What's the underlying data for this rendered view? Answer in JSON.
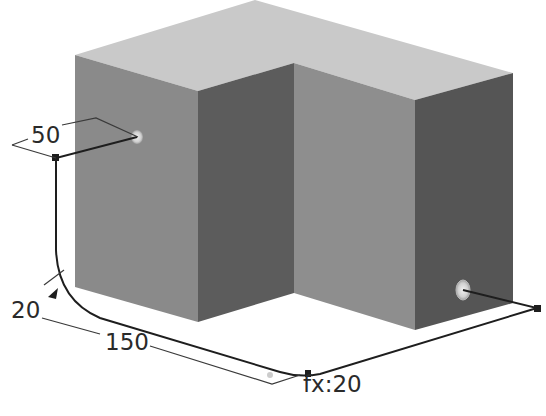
{
  "diagram": {
    "colors": {
      "background": "#ffffff",
      "top_face": "#c9c9c9",
      "left_face": "#8a8a8a",
      "front_inner_face": "#5c5c5c",
      "inner_right_face": "#8e8e8e",
      "right_front_face": "#555555",
      "path_line": "#1e1e1e",
      "dimension_line": "#3a3a3a",
      "hole_marker": "#dcdcdc"
    },
    "dimensions": {
      "width_label": "50",
      "fillet_radius_label": "20",
      "length_label": "150",
      "fillet_expression_label": "fx:20"
    }
  }
}
